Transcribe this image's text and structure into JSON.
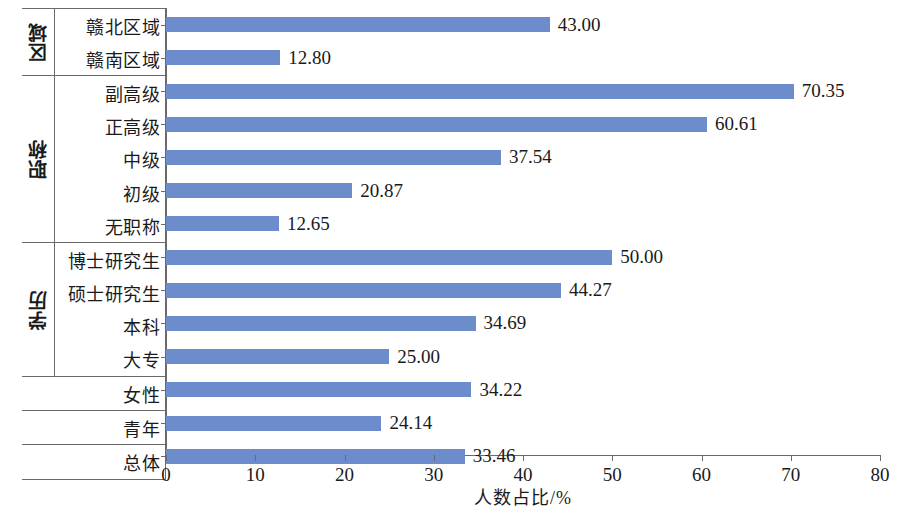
{
  "chart_data": {
    "type": "bar",
    "orientation": "horizontal",
    "title": "",
    "xlabel": "人数占比/%",
    "ylabel": "",
    "xlim": [
      0,
      80
    ],
    "xticks": [
      0,
      10,
      20,
      30,
      40,
      50,
      60,
      70,
      80
    ],
    "grid": false,
    "legend": false,
    "bar_color": "#6c8ccc",
    "axis_color": "#6a6a6a",
    "value_label_format": "0.00",
    "categories": [
      "赣北区域",
      "赣南区域",
      "副高级",
      "正高级",
      "中级",
      "初级",
      "无职称",
      "博士研究生",
      "硕士研究生",
      "本科",
      "大专",
      "女性",
      "青年",
      "总体"
    ],
    "values": [
      43.0,
      12.8,
      70.35,
      60.61,
      37.54,
      20.87,
      12.65,
      50.0,
      44.27,
      34.69,
      25.0,
      34.22,
      24.14,
      33.46
    ],
    "groups": [
      {
        "label": "区域",
        "has_label": true,
        "rows": [
          {
            "category": "赣北区域",
            "value": 43.0,
            "value_label": "43.00"
          },
          {
            "category": "赣南区域",
            "value": 12.8,
            "value_label": "12.80"
          }
        ]
      },
      {
        "label": "职称",
        "has_label": true,
        "rows": [
          {
            "category": "副高级",
            "value": 70.35,
            "value_label": "70.35"
          },
          {
            "category": "正高级",
            "value": 60.61,
            "value_label": "60.61"
          },
          {
            "category": "中级",
            "value": 37.54,
            "value_label": "37.54"
          },
          {
            "category": "初级",
            "value": 20.87,
            "value_label": "20.87"
          },
          {
            "category": "无职称",
            "value": 12.65,
            "value_label": "12.65"
          }
        ]
      },
      {
        "label": "学历",
        "has_label": true,
        "rows": [
          {
            "category": "博士研究生",
            "value": 50.0,
            "value_label": "50.00"
          },
          {
            "category": "硕士研究生",
            "value": 44.27,
            "value_label": "44.27"
          },
          {
            "category": "本科",
            "value": 34.69,
            "value_label": "34.69"
          },
          {
            "category": "大专",
            "value": 25.0,
            "value_label": "25.00"
          }
        ]
      },
      {
        "label": "",
        "has_label": false,
        "rows": [
          {
            "category": "女性",
            "value": 34.22,
            "value_label": "34.22"
          }
        ]
      },
      {
        "label": "",
        "has_label": false,
        "rows": [
          {
            "category": "青年",
            "value": 24.14,
            "value_label": "24.14"
          }
        ]
      },
      {
        "label": "",
        "has_label": false,
        "rows": [
          {
            "category": "总体",
            "value": 33.46,
            "value_label": "33.46"
          }
        ]
      }
    ],
    "xtick_labels": [
      "0",
      "10",
      "20",
      "30",
      "40",
      "50",
      "60",
      "70",
      "80"
    ]
  }
}
